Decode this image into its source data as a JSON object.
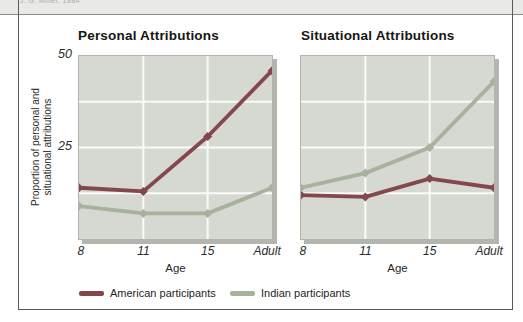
{
  "page": {
    "credit": "J. G. Miller, 1984"
  },
  "colors": {
    "american": "#84474e",
    "indian": "#a7b29d",
    "plot_background": "#d6d8d2",
    "plot_border": "#b2b4ae",
    "plot_shadow": "#b3b5af",
    "gridline": "#fafbf8",
    "strip_background": "#e9e9e6",
    "frame_border": "#59595b"
  },
  "y_axis": {
    "label_line1": "Proportion of personal and",
    "label_line2": "situational attributions",
    "ticks": [
      "50",
      "25"
    ]
  },
  "legend": [
    {
      "label": "American participants",
      "color": "#84474e"
    },
    {
      "label": "Indian participants",
      "color": "#a7b29d"
    }
  ],
  "chart_data": [
    {
      "type": "line",
      "title": "Personal Attributions",
      "x_categories": [
        "8",
        "11",
        "15",
        "Adult"
      ],
      "xlabel": "Age",
      "ylabel": "Proportion of personal and situational attributions",
      "ylim": [
        0,
        50
      ],
      "ytick_values": [
        25,
        50
      ],
      "gridlines": {
        "horizontal_values": [
          12.5,
          25,
          37.5
        ],
        "vertical_at": [
          "11",
          "15"
        ]
      },
      "legend_position": "below",
      "series": [
        {
          "name": "American participants",
          "color": "#84474e",
          "values": [
            14,
            13,
            28,
            46
          ]
        },
        {
          "name": "Indian participants",
          "color": "#a7b29d",
          "values": [
            9,
            7,
            7,
            14
          ]
        }
      ]
    },
    {
      "type": "line",
      "title": "Situational Attributions",
      "x_categories": [
        "8",
        "11",
        "15",
        "Adult"
      ],
      "xlabel": "Age",
      "ylabel": "Proportion of personal and situational attributions",
      "ylim": [
        0,
        50
      ],
      "ytick_values": [
        25,
        50
      ],
      "gridlines": {
        "horizontal_values": [
          12.5,
          25,
          37.5
        ],
        "vertical_at": [
          "11",
          "15"
        ]
      },
      "legend_position": "below",
      "series": [
        {
          "name": "American participants",
          "color": "#84474e",
          "values": [
            12,
            11.5,
            16.5,
            14
          ]
        },
        {
          "name": "Indian participants",
          "color": "#a7b29d",
          "values": [
            14,
            18,
            25,
            43
          ]
        }
      ]
    }
  ]
}
